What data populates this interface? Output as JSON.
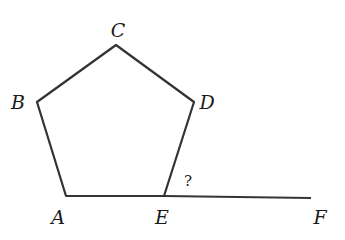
{
  "diagram": {
    "type": "geometry",
    "stroke_color": "#333333",
    "vertices": {
      "A": [
        66,
        196
      ],
      "B": [
        37,
        102
      ],
      "C": [
        116,
        45
      ],
      "D": [
        194,
        102
      ],
      "E": [
        164,
        196
      ],
      "F": [
        311,
        198
      ]
    },
    "labels": {
      "A": "A",
      "B": "B",
      "C": "C",
      "D": "D",
      "E": "E",
      "F": "F",
      "angle": "?"
    }
  }
}
